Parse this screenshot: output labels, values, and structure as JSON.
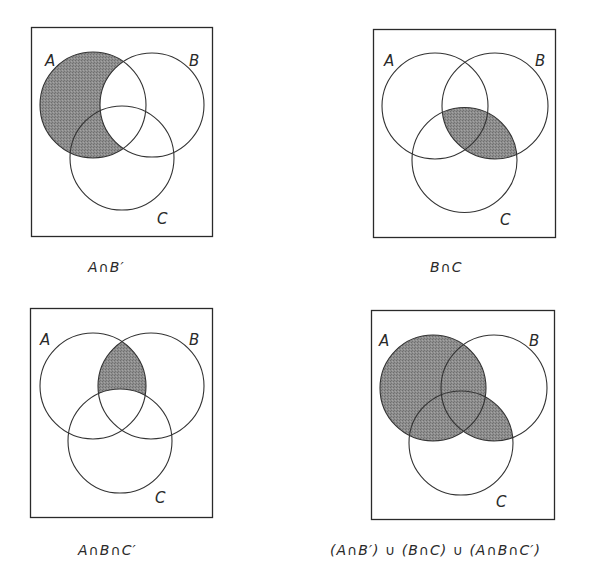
{
  "figure": {
    "shade_color": "#8a8a8a",
    "line_color": "#333333",
    "panels": [
      {
        "id": "a-and-not-b",
        "caption": "A∩B′",
        "shaded_region": "A minus B",
        "labels": {
          "A": "A",
          "B": "B",
          "C": "C"
        }
      },
      {
        "id": "b-and-c",
        "caption": "B∩C",
        "shaded_region": "B intersect C",
        "labels": {
          "A": "A",
          "B": "B",
          "C": "C"
        }
      },
      {
        "id": "a-and-b-and-not-c",
        "caption": "A∩B∩C′",
        "shaded_region": "A intersect B minus C",
        "labels": {
          "A": "A",
          "B": "B",
          "C": "C"
        }
      },
      {
        "id": "union",
        "caption": "(A∩B′) ∪ (B∩C) ∪ (A∩B∩C′)",
        "shaded_region": "A union (B intersect C)",
        "labels": {
          "A": "A",
          "B": "B",
          "C": "C"
        }
      }
    ]
  }
}
